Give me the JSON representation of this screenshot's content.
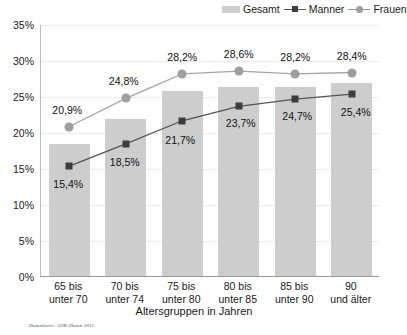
{
  "legend": {
    "items": [
      {
        "label": "Gesamt",
        "marker": "bar-swatch",
        "color": "#cdcdcd"
      },
      {
        "label": "Manner",
        "marker": "square-line",
        "color": "#3d3d3d"
      },
      {
        "label": "Frauen",
        "marker": "circle-line",
        "color": "#9e9e9e"
      }
    ]
  },
  "axis": {
    "y_ticks": [
      "0%",
      "5%",
      "10%",
      "15%",
      "20%",
      "25%",
      "30%",
      "35%"
    ],
    "x_title": "Altersgruppen in Jahren"
  },
  "source_note": "Datenbasis: AOK-Daten 2011",
  "chart_data": {
    "type": "bar",
    "title": "",
    "subtitle": "",
    "xlabel": "Altersgruppen in Jahren",
    "ylabel": "",
    "ylim": [
      0,
      35
    ],
    "ytick_step": 5,
    "ytick_format": "percent-de",
    "grid": true,
    "legend_position": "top-right",
    "categories": [
      "65 bis\nunter 70",
      "70 bis\nunter 74",
      "75 bis\nunter 80",
      "80 bis\nunter 85",
      "85 bis\nunter 90",
      "90\nund älter"
    ],
    "categories_lines": [
      [
        "65 bis",
        "unter 70"
      ],
      [
        "70 bis",
        "unter 74"
      ],
      [
        "75 bis",
        "unter 80"
      ],
      [
        "80 bis",
        "unter 85"
      ],
      [
        "85 bis",
        "unter 90"
      ],
      [
        "90",
        "und älter"
      ]
    ],
    "series": [
      {
        "name": "Gesamt",
        "type": "bar",
        "color": "#cdcdcd",
        "labels_shown": false,
        "values": [
          18.4,
          21.8,
          25.7,
          26.2,
          26.3,
          26.8
        ],
        "value_labels": [
          "",
          "",
          "",
          "",
          "",
          ""
        ]
      },
      {
        "name": "Manner",
        "type": "line",
        "marker": "square",
        "color": "#3d3d3d",
        "labels_shown": true,
        "values": [
          15.4,
          18.5,
          21.7,
          23.7,
          24.7,
          25.4
        ],
        "value_labels": [
          "15,4%",
          "18,5%",
          "21,7%",
          "23,7%",
          "24,7%",
          "25,4%"
        ]
      },
      {
        "name": "Frauen",
        "type": "line",
        "marker": "circle",
        "color": "#9e9e9e",
        "labels_shown": true,
        "values": [
          20.9,
          24.8,
          28.2,
          28.6,
          28.2,
          28.4
        ],
        "value_labels": [
          "20,9%",
          "24,8%",
          "28,2%",
          "28,6%",
          "28,2%",
          "28,4%"
        ]
      }
    ]
  }
}
